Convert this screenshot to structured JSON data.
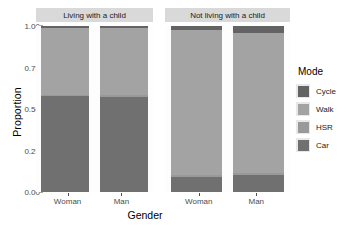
{
  "chart_data": {
    "type": "bar",
    "subtype": "stacked-proportion-faceted",
    "title": "",
    "xlabel": "Gender",
    "ylabel": "Proportion",
    "ylim": [
      0,
      1
    ],
    "ytick_labels": [
      "0.00",
      "0.25",
      "0.50",
      "0.75",
      "1.00"
    ],
    "ytick_values": [
      0,
      0.25,
      0.5,
      0.75,
      1
    ],
    "grid": false,
    "legend_position": "right",
    "legend_title": "Mode",
    "categories": [
      "Woman",
      "Man"
    ],
    "facets": [
      "Living with a child",
      "Not living with a child"
    ],
    "series": [
      {
        "name": "Cycle",
        "color": "#636363",
        "values_by_facet": {
          "Living with a child": [
            0.01,
            0.012
          ],
          "Not living with a child": [
            0.022,
            0.042
          ]
        }
      },
      {
        "name": "Walk",
        "color": "#a3a3a3",
        "values_by_facet": {
          "Living with a child": [
            0.405,
            0.405
          ],
          "Not living with a child": [
            0.878,
            0.843
          ]
        }
      },
      {
        "name": "HSR",
        "color": "#999999",
        "values_by_facet": {
          "Living with a child": [
            0.005,
            0.008
          ],
          "Not living with a child": [
            0.01,
            0.01
          ]
        }
      },
      {
        "name": "Car",
        "color": "#707070",
        "values_by_facet": {
          "Living with a child": [
            0.58,
            0.575
          ],
          "Not living with a child": [
            0.09,
            0.105
          ]
        }
      }
    ],
    "panels": [
      {
        "facet": "Living with a child",
        "bars": [
          {
            "category": "Woman",
            "segments": [
              {
                "mode": "Cycle",
                "value": 0.01
              },
              {
                "mode": "Walk",
                "value": 0.405
              },
              {
                "mode": "HSR",
                "value": 0.005
              },
              {
                "mode": "Car",
                "value": 0.58
              }
            ]
          },
          {
            "category": "Man",
            "segments": [
              {
                "mode": "Cycle",
                "value": 0.012
              },
              {
                "mode": "Walk",
                "value": 0.405
              },
              {
                "mode": "HSR",
                "value": 0.008
              },
              {
                "mode": "Car",
                "value": 0.575
              }
            ]
          }
        ]
      },
      {
        "facet": "Not living with a child",
        "bars": [
          {
            "category": "Woman",
            "segments": [
              {
                "mode": "Cycle",
                "value": 0.022
              },
              {
                "mode": "Walk",
                "value": 0.878
              },
              {
                "mode": "HSR",
                "value": 0.01
              },
              {
                "mode": "Car",
                "value": 0.09
              }
            ]
          },
          {
            "category": "Man",
            "segments": [
              {
                "mode": "Cycle",
                "value": 0.042
              },
              {
                "mode": "Walk",
                "value": 0.843
              },
              {
                "mode": "HSR",
                "value": 0.01
              },
              {
                "mode": "Car",
                "value": 0.105
              }
            ]
          }
        ]
      }
    ],
    "colors": {
      "cycle": "#636363",
      "walk": "#a3a3a3",
      "hsr": "#999999",
      "car": "#707070",
      "panel_background": "#fdfdfd",
      "strip_background": "#d9d9d9",
      "axis_text": "#4d4d4d",
      "plot_background": "#ffffff"
    }
  }
}
